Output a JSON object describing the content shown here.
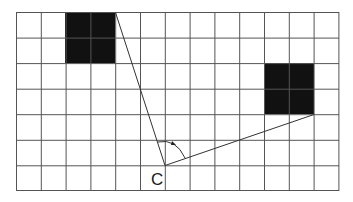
{
  "diagram": {
    "grid": {
      "columns": 13,
      "rows": 7,
      "line_color": "#555555",
      "background": "#ffffff"
    },
    "squares": [
      {
        "name": "upper-left-square",
        "col": 2,
        "row": 0,
        "width_cells": 2,
        "height_cells": 2,
        "color": "#111111"
      },
      {
        "name": "right-square",
        "col": 10,
        "row": 2,
        "width_cells": 2,
        "height_cells": 2,
        "color": "#111111"
      }
    ],
    "point": {
      "label": "C",
      "col_line": 6,
      "row_line": 6
    },
    "rays": [
      {
        "from": "C",
        "to": "top-right corner of upper-left-square"
      },
      {
        "from": "C",
        "to": "bottom-right corner of right-square"
      }
    ],
    "angle_arc": {
      "at": "C",
      "arrow": true
    }
  }
}
